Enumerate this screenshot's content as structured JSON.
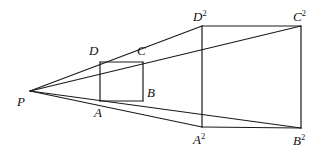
{
  "figure": {
    "type": "geometric-diagram",
    "background_color": "#ffffff",
    "stroke_color": "#1a1a1a",
    "stroke_width": 1.2,
    "canvas": {
      "width": 332,
      "height": 154
    }
  },
  "points": {
    "P": {
      "label": "P",
      "exponent": "",
      "x": 30,
      "y": 91,
      "label_x": 17,
      "label_y": 95
    },
    "A": {
      "label": "A",
      "exponent": "",
      "x": 100,
      "y": 101,
      "label_x": 94,
      "label_y": 106
    },
    "B": {
      "label": "B",
      "exponent": "",
      "x": 143,
      "y": 101,
      "label_x": 147,
      "label_y": 86
    },
    "C": {
      "label": "C",
      "exponent": "",
      "x": 143,
      "y": 62,
      "label_x": 137,
      "label_y": 44
    },
    "D": {
      "label": "D",
      "exponent": "",
      "x": 100,
      "y": 62,
      "label_x": 89,
      "label_y": 44
    },
    "A2": {
      "label": "A",
      "exponent": "2",
      "x": 202,
      "y": 127,
      "label_x": 193,
      "label_y": 132
    },
    "B2": {
      "label": "B",
      "exponent": "2",
      "x": 301,
      "y": 128,
      "label_x": 293,
      "label_y": 133
    },
    "C2": {
      "label": "C",
      "exponent": "2",
      "x": 301,
      "y": 26,
      "label_x": 293,
      "label_y": 9
    },
    "D2": {
      "label": "D",
      "exponent": "2",
      "x": 202,
      "y": 26,
      "label_x": 193,
      "label_y": 9
    }
  },
  "segments": [
    {
      "name": "ray-P-to-D2",
      "from": "P",
      "to": "D2"
    },
    {
      "name": "ray-P-to-C2",
      "from": "P",
      "to": "C2"
    },
    {
      "name": "ray-P-to-A2",
      "from": "P",
      "to": "A2"
    },
    {
      "name": "ray-P-to-B2",
      "from": "P",
      "to": "B2"
    },
    {
      "name": "small-square-top-DC",
      "from": "D",
      "to": "C"
    },
    {
      "name": "small-square-right-CB",
      "from": "C",
      "to": "B"
    },
    {
      "name": "small-square-bottom-AB",
      "from": "A",
      "to": "B"
    },
    {
      "name": "small-square-left-DA",
      "from": "D",
      "to": "A"
    },
    {
      "name": "large-square-top-D2C2",
      "from": "D2",
      "to": "C2"
    },
    {
      "name": "large-square-right-C2B2",
      "from": "C2",
      "to": "B2"
    },
    {
      "name": "large-square-bottom-A2B2",
      "from": "A2",
      "to": "B2"
    },
    {
      "name": "large-square-left-D2A2",
      "from": "D2",
      "to": "A2"
    }
  ],
  "labels_order": [
    "P",
    "A",
    "B",
    "C",
    "D",
    "A2",
    "B2",
    "C2",
    "D2"
  ]
}
